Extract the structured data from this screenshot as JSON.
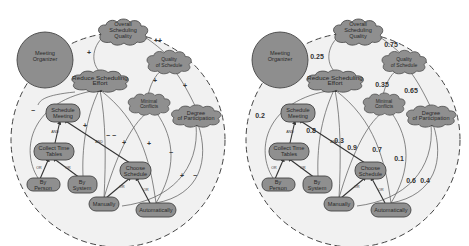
{
  "diagrams": [
    {
      "id": "left",
      "variant": "qualitative",
      "actor": "Meeting Organizer",
      "softgoals": {
        "overall": "Overall Scheduling Quality",
        "quality": "Quality of Schedule",
        "reduce": "Reduce Scheduling Effort",
        "conflicts": "Minimal Conflicts",
        "participation": "Degree of Participation"
      },
      "tasks": {
        "schedule": "Schedule Meeting",
        "collect": "Collect Time Tables",
        "by_person": "By Person",
        "by_system": "By System",
        "choose": "Choose Schedule",
        "manually": "Manually",
        "automatically": "Automatically"
      },
      "decomposition_labels": {
        "and1": "AND",
        "and2": "AND",
        "or1": "OR",
        "or2": "OR",
        "or3": "OR",
        "or4": "OR"
      },
      "contributions": {
        "reduce_to_overall": "+",
        "quality_to_overall": "++",
        "conflicts_to_quality": "+",
        "participation_to_quality": "+",
        "byperson_to_reduce": "−",
        "bysystem_to_reduce": "+",
        "manually_to_reduce": "− −",
        "manually_to_conflicts": "+",
        "auto_to_reduce": "+",
        "auto_to_conflicts": "−",
        "manually_to_participation": "+",
        "auto_to_participation": "−"
      }
    },
    {
      "id": "right",
      "variant": "quantitative",
      "actor": "Meeting Organizer",
      "softgoals": {
        "overall": "Overall Scheduling Quality",
        "quality": "Quality of Schedule",
        "reduce": "Reduce Scheduling Effort",
        "conflicts": "Minimal Conflicts",
        "participation": "Degree of Participation"
      },
      "tasks": {
        "schedule": "Schedule Meeting",
        "collect": "Collect Time Tables",
        "by_person": "By Person",
        "by_system": "By System",
        "choose": "Choose Schedule",
        "manually": "Manually",
        "automatically": "Automatically"
      },
      "decomposition_labels": {
        "and1": "AND",
        "and2": "AND",
        "or1": "OR",
        "or2": "OR",
        "or3": "OR",
        "or4": "OR"
      },
      "contributions": {
        "reduce_to_overall": "0.25",
        "quality_to_overall": "0.75",
        "conflicts_to_quality": "0.35",
        "participation_to_quality": "0.65",
        "byperson_to_reduce": "0.2",
        "bysystem_to_reduce": "0.8",
        "manually_to_reduce": "0.3",
        "manually_to_conflicts": "0.9",
        "auto_to_reduce": "0.7",
        "auto_to_conflicts": "0.1",
        "manually_to_participation": "0.6",
        "auto_to_participation": "0.4"
      }
    }
  ]
}
